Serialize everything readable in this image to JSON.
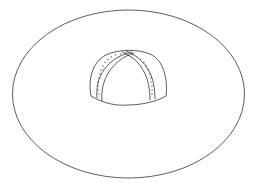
{
  "figure": {
    "stroke_color": "#333333",
    "background": "#ffffff",
    "brim": {
      "cx": 128.5,
      "cy": 94,
      "rx": 116,
      "ry": 84
    },
    "crown": {
      "left": 89,
      "right": 168,
      "top": 50,
      "bottom": 106
    }
  }
}
